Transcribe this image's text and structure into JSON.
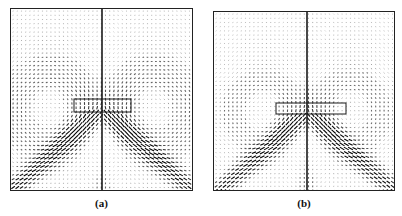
{
  "figure": {
    "panels": [
      {
        "id": "a",
        "label": "(a)",
        "frame": {
          "x": 10,
          "y": 8,
          "w": 183,
          "h": 183
        },
        "center_bar_x": 91,
        "inner_rect": {
          "x": 63,
          "y": 90,
          "w": 57,
          "h": 13
        },
        "vortex": {
          "cx_off": 50,
          "cy": 100,
          "spread": 36,
          "tail_y": 140
        }
      },
      {
        "id": "b",
        "label": "(b)",
        "frame": {
          "x": 213,
          "y": 11,
          "w": 182,
          "h": 180
        },
        "center_bar_x": 93,
        "inner_rect": {
          "x": 62,
          "y": 91,
          "w": 70,
          "h": 11
        },
        "vortex": {
          "cx_off": 40,
          "cy": 100,
          "spread": 32,
          "tail_y": 145
        }
      }
    ],
    "label_y": 197,
    "stroke_color": "#1a1a1a"
  }
}
